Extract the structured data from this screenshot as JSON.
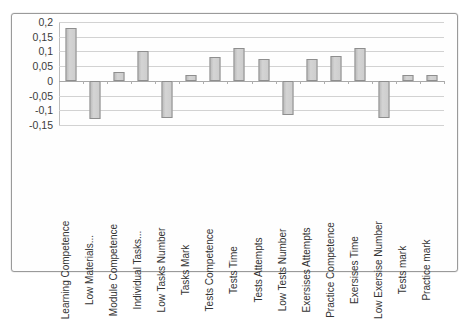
{
  "chart_data": {
    "type": "bar",
    "title": "",
    "subtitle": "",
    "xlabel": "",
    "ylabel": "",
    "ylim": [
      -0.15,
      0.2
    ],
    "grid": true,
    "legend": "none",
    "decimal_separator": ",",
    "ytick_labels": [
      "0,2",
      "0,15",
      "0,1",
      "0,05",
      "0",
      "-0,05",
      "-0,1",
      "-0,15"
    ],
    "ytick_values": [
      0.2,
      0.15,
      0.1,
      0.05,
      0,
      -0.05,
      -0.1,
      -0.15
    ],
    "categories": [
      "Learning Competence",
      "Low Materials...",
      "Module Competence",
      "Individual Tasks...",
      "Low Tasks Number",
      "Tasks Mark",
      "Tests Competence",
      "Tests Time",
      "Tests Attempts",
      "Low Tests Number",
      "Exersises Attempts",
      "Practice Competence",
      "Exersises Time",
      "Low Exersise Number",
      "Tests mark",
      "Practice mark"
    ],
    "values": [
      0.18,
      -0.13,
      0.03,
      0.1,
      -0.125,
      0.02,
      0.08,
      0.11,
      0.075,
      -0.115,
      0.075,
      0.085,
      0.11,
      -0.125,
      0.02,
      0.02
    ],
    "series": [
      {
        "name": "Series 1",
        "values": [
          0.18,
          -0.13,
          0.03,
          0.1,
          -0.125,
          0.02,
          0.08,
          0.11,
          0.075,
          -0.115,
          0.075,
          0.085,
          0.11,
          -0.125,
          0.02,
          0.02
        ]
      }
    ],
    "colors": {
      "bar_fill": "#cbcbcb",
      "bar_border": "#8e8e8e",
      "gridline": "#d2d2d2",
      "zero_axis": "#a8a8a8",
      "frame_border": "#9a9a9a",
      "text": "#333333"
    }
  }
}
